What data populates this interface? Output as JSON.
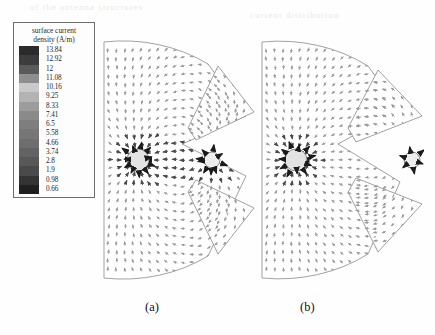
{
  "figure": {
    "caption_a": "(a)",
    "caption_b": "(b)",
    "background_color": "#fefefe"
  },
  "legend": {
    "title_line1": "surface current",
    "title_line2": "density (A/m)",
    "units": "A/m",
    "border_color": "#6d6d6d",
    "levels": [
      {
        "value": "13.84",
        "color": "#2b2b2b"
      },
      {
        "value": "12.92",
        "color": "#3c3c3c"
      },
      {
        "value": "12",
        "color": "#5a5a5a"
      },
      {
        "value": "11.08",
        "color": "#8e8e8e"
      },
      {
        "value": "10.16",
        "color": "#c9c9c9"
      },
      {
        "value": "9.25",
        "color": "#b3b3b3"
      },
      {
        "value": "8.33",
        "color": "#9c9c9c"
      },
      {
        "value": "7.41",
        "color": "#8a8a8a"
      },
      {
        "value": "6.5",
        "color": "#7e7e7e"
      },
      {
        "value": "5.58",
        "color": "#767676"
      },
      {
        "value": "4.66",
        "color": "#6e6e6e"
      },
      {
        "value": "3.74",
        "color": "#636363"
      },
      {
        "value": "2.8",
        "color": "#585858"
      },
      {
        "value": "1.9",
        "color": "#4a4a4a"
      },
      {
        "value": "0.98",
        "color": "#343434"
      },
      {
        "value": "0.66",
        "color": "#1f1f1f"
      }
    ]
  },
  "chart_data": {
    "type": "heatmap",
    "title": "surface current density (A/m)",
    "xlabel": "",
    "ylabel": "",
    "grid": false,
    "legend_position": "left",
    "colormap": "grayscale-inverted",
    "value_range": [
      0.66,
      13.84
    ],
    "tick_labels": [
      "13.84",
      "12.92",
      "12",
      "11.08",
      "10.16",
      "9.25",
      "8.33",
      "7.41",
      "6.5",
      "5.58",
      "4.66",
      "3.74",
      "2.8",
      "1.9",
      "0.98",
      "0.66"
    ],
    "panels": [
      {
        "label": "(a)",
        "description": "sector antenna with single radial slot, two feed points, surface current vector field",
        "feed_points": 2,
        "slots": 2,
        "peak_value": 13.84
      },
      {
        "label": "(b)",
        "description": "sector antenna with two radial slots, two feed points, surface current vector field",
        "feed_points": 2,
        "slots": 2,
        "peak_value": 13.84
      }
    ]
  },
  "bleed_text": {
    "row1": "of the antenna structures",
    "row2": "current distribution"
  }
}
